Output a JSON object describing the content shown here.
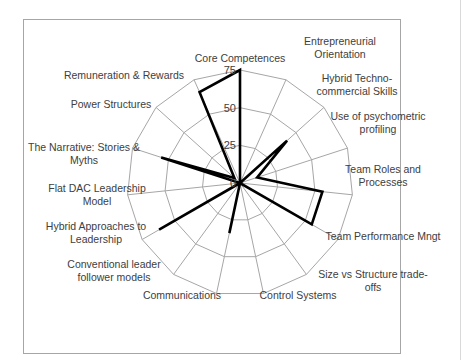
{
  "chart_data": {
    "type": "radar",
    "title": "",
    "categories": [
      "Core Competences",
      "Entrepreneurial Orientation",
      "Hybrid Techno-commercial Skills",
      "Use of psychometric profiling",
      "Team Roles and Processes",
      "Team Performance Mngt",
      "Size vs Structure trade-offs",
      "Control Systems",
      "Communications",
      "Conventional leader follower models",
      "Hybrid Approaches to Leadership",
      "Flat DAC Leadership Model",
      "The Narrative: Stories & Myths",
      "Power Structures",
      "Remuneration & Rewards"
    ],
    "series": [
      {
        "name": "Series 1",
        "values": [
          75,
          0,
          42,
          12,
          55,
          55,
          0,
          0,
          34,
          0,
          62,
          0,
          55,
          5,
          66
        ],
        "color": "#000000"
      }
    ],
    "radial_ticks": [
      0,
      25,
      50,
      75
    ],
    "rlim": [
      0,
      75
    ],
    "grid": true,
    "legend": "none"
  },
  "labels": {
    "lines": [
      [
        "Core Competences"
      ],
      [
        "Entrepreneurial",
        "Orientation"
      ],
      [
        "Hybrid Techno-",
        "commercial Skills"
      ],
      [
        "Use of psychometric",
        "profiling"
      ],
      [
        "Team Roles and",
        "Processes"
      ],
      [
        "Team Performance Mngt"
      ],
      [
        "Size vs Structure trade-",
        "offs"
      ],
      [
        "Control Systems"
      ],
      [
        "Communications"
      ],
      [
        "Conventional leader",
        "follower models"
      ],
      [
        "Hybrid Approaches to",
        "Leadership"
      ],
      [
        "Flat DAC Leadership",
        "Model"
      ],
      [
        "The Narrative: Stories &",
        "Myths"
      ],
      [
        "Power Structures"
      ],
      [
        "Remuneration & Rewards"
      ]
    ]
  },
  "colors": {
    "grid": "#a6a6a6",
    "series": "#000000",
    "text": "#404040",
    "frame": "#a6a6a6"
  }
}
